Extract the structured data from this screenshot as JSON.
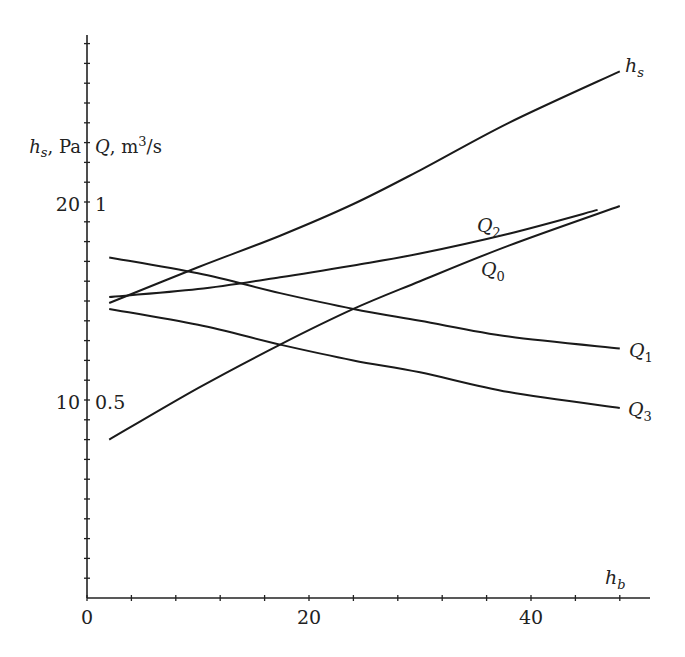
{
  "chart_data": {
    "type": "line",
    "title": "",
    "xlabel": "h_b",
    "ylabel_left": "h_s, Pa",
    "ylabel_right": "Q, m^3/s",
    "xlim": [
      0,
      50
    ],
    "ylim_left": [
      0,
      28.5
    ],
    "ylim_right": [
      0,
      1.425
    ],
    "grid": false,
    "legend": "inline labels at line ends",
    "x_ticks": [
      0,
      20,
      40
    ],
    "x_minor_step": 4,
    "y_left_ticks": [
      10,
      20
    ],
    "y_right_ticks": [
      0.5,
      1
    ],
    "y_minor_step": 1,
    "x": [
      2,
      10,
      17.4,
      24,
      30,
      38,
      46,
      48
    ],
    "series": [
      {
        "name": "h_s",
        "axis": "left",
        "points": [
          [
            2,
            14.9
          ],
          [
            10,
            16.7
          ],
          [
            17.4,
            18.3
          ],
          [
            24,
            19.9
          ],
          [
            30,
            21.6
          ],
          [
            38,
            24.0
          ],
          [
            48,
            26.6
          ]
        ]
      },
      {
        "name": "Q2",
        "axis": "right",
        "points": [
          [
            2,
            0.76
          ],
          [
            10,
            0.78
          ],
          [
            17.4,
            0.81
          ],
          [
            24,
            0.84
          ],
          [
            30,
            0.87
          ],
          [
            38,
            0.92
          ],
          [
            46,
            0.98
          ]
        ]
      },
      {
        "name": "Q0",
        "axis": "right",
        "points": [
          [
            2,
            0.4
          ],
          [
            10,
            0.53
          ],
          [
            17.4,
            0.64
          ],
          [
            24,
            0.73
          ],
          [
            30,
            0.8
          ],
          [
            38,
            0.89
          ],
          [
            48,
            0.99
          ]
        ]
      },
      {
        "name": "Q1",
        "axis": "right",
        "points": [
          [
            2,
            0.86
          ],
          [
            10,
            0.82
          ],
          [
            17.4,
            0.77
          ],
          [
            24,
            0.73
          ],
          [
            30,
            0.7
          ],
          [
            38,
            0.66
          ],
          [
            48,
            0.63
          ]
        ]
      },
      {
        "name": "Q3",
        "axis": "right",
        "points": [
          [
            2,
            0.73
          ],
          [
            10,
            0.69
          ],
          [
            17.4,
            0.64
          ],
          [
            24,
            0.6
          ],
          [
            30,
            0.57
          ],
          [
            38,
            0.52
          ],
          [
            48,
            0.48
          ]
        ]
      }
    ]
  },
  "labels": {
    "x_axis_title_main": "h",
    "x_axis_title_sub": "b",
    "y_left_title_main": "h",
    "y_left_title_sub": "s",
    "y_left_title_unit": ", Pa",
    "y_right_title_main": "Q",
    "y_right_title_unit": ", m",
    "y_right_title_sup": "3",
    "y_right_title_tail": "/s",
    "x_tick_0": "0",
    "x_tick_20": "20",
    "x_tick_40": "40",
    "y_left_tick_10": "10",
    "y_left_tick_20": "20",
    "y_right_tick_05": "0.5",
    "y_right_tick_1": "1",
    "series_hs_main": "h",
    "series_hs_sub": "s",
    "series_q_main": "Q",
    "series_q2_sub": "2",
    "series_q0_sub": "0",
    "series_q1_sub": "1",
    "series_q3_sub": "3"
  },
  "colors": {
    "line": "#1a1a1a",
    "axis": "#222222",
    "background": "#ffffff"
  }
}
